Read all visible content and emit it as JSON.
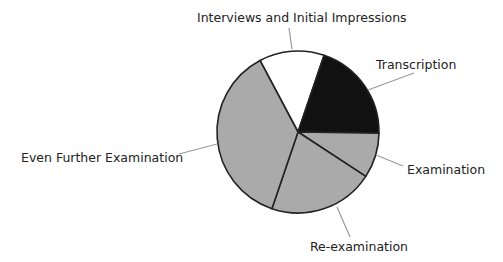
{
  "chart_data": {
    "type": "pie",
    "title": "",
    "start_angle_deg": -28,
    "direction": "clockwise",
    "categories": [
      "Interviews and Initial Impressions",
      "Transcription",
      "Examination",
      "Re-examination",
      "Even Further Examination"
    ],
    "values": [
      13,
      20,
      9,
      21,
      37
    ],
    "colors": [
      "#ffffff",
      "#111111",
      "#aaaaaa",
      "#aaaaaa",
      "#aaaaaa"
    ],
    "legend": "none (direct labels with leader lines)"
  },
  "style": {
    "outline_color": "#222222",
    "leader_color": "#9a9a9a",
    "text_color": "#222222",
    "background": "#ffffff"
  },
  "labels": [
    {
      "text": "Interviews and Initial Impressions",
      "x": 197,
      "y": 22,
      "line": [
        [
          289,
          28
        ],
        [
          292,
          49
        ]
      ]
    },
    {
      "text": "Transcription",
      "x": 376,
      "y": 69,
      "line": [
        [
          414,
          73
        ],
        [
          368,
          90
        ]
      ]
    },
    {
      "text": "Examination",
      "x": 407,
      "y": 174,
      "line": [
        [
          376,
          155
        ],
        [
          403,
          166
        ]
      ]
    },
    {
      "text": "Re-examination",
      "x": 310,
      "y": 251,
      "line": [
        [
          337,
          207
        ],
        [
          350,
          237
        ]
      ]
    },
    {
      "text": "Even Further Examination",
      "x": 21,
      "y": 162,
      "line": [
        [
          179,
          154
        ],
        [
          217,
          144
        ]
      ]
    }
  ],
  "geometry": {
    "cx": 298,
    "cy": 132,
    "r": 81
  }
}
